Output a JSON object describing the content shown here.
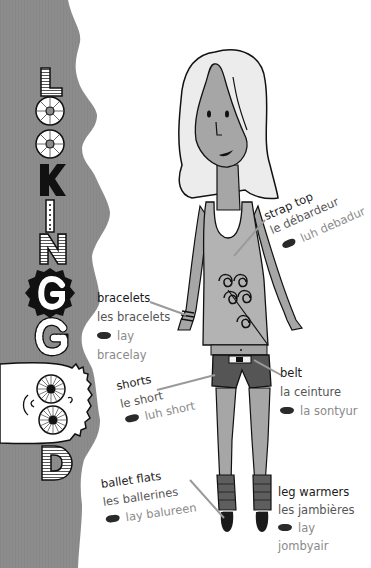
{
  "title": {
    "letters": [
      "L",
      "O",
      "O",
      "K",
      "I",
      "N",
      "G",
      "G",
      "O",
      "O",
      "D"
    ],
    "text": "LOOKING GOOD"
  },
  "colors": {
    "banner_grey": "#8c8c8c",
    "skin_grey": "#a6a6a6",
    "hair": "#ececec",
    "top_grey": "#b3b3b3",
    "shorts": "#555555",
    "leg_warmers": "#5e5e5e",
    "shoes": "#1a1a1a",
    "leader_line": "#9a9a9a",
    "english_text": "#1a1a1a",
    "french_text": "#555555",
    "phonetic_text": "#8a8a8a"
  },
  "labels": [
    {
      "id": "strap-top",
      "english": "strap top",
      "french": "le débardeur",
      "phonetic_icon": "lips-icon",
      "phonetic": "luh debadur"
    },
    {
      "id": "bracelets",
      "english": "bracelets",
      "french": "les bracelets",
      "phonetic_icon": "lips-icon",
      "phonetic_line1": "lay",
      "phonetic_line2": "bracelay"
    },
    {
      "id": "shorts",
      "english": "shorts",
      "french": "le short",
      "phonetic_icon": "lips-icon",
      "phonetic": "luh short"
    },
    {
      "id": "belt",
      "english": "belt",
      "french": "la ceinture",
      "phonetic_icon": "lips-icon",
      "phonetic": "la sontyur"
    },
    {
      "id": "ballet-flats",
      "english": "ballet flats",
      "french": "les ballerines",
      "phonetic_icon": "lips-icon",
      "phonetic": "lay balureen"
    },
    {
      "id": "leg-warmers",
      "english": "leg warmers",
      "french": "les jambières",
      "phonetic_icon": "lips-icon",
      "phonetic_line1": "lay",
      "phonetic_line2": "jombyair"
    }
  ]
}
